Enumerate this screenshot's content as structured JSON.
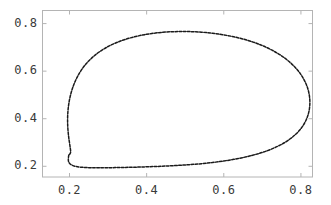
{
  "chart_data": {
    "type": "scatter",
    "title": "",
    "subtitle": "",
    "xlabel": "",
    "ylabel": "",
    "xlim": [
      0.13,
      0.83
    ],
    "ylim": [
      0.155,
      0.855
    ],
    "grid": false,
    "legend": null,
    "marker": "dot",
    "line_style": "dotted-closed-curve",
    "series_color": "#1a1a1a",
    "frame_color": "#b4b4b4",
    "background": "#ffffff",
    "xticks": [
      0.2,
      0.4,
      0.6,
      0.8
    ],
    "xtick_labels": [
      "0.2",
      "0.4",
      "0.6",
      "0.8"
    ],
    "yticks": [
      0.2,
      0.4,
      0.6,
      0.8
    ],
    "ytick_labels": [
      "0.2",
      "0.4",
      "0.6",
      "0.8"
    ],
    "series": [
      {
        "name": "orbit",
        "closed": true,
        "points": [
          [
            0.1985,
            0.248
          ],
          [
            0.197,
            0.233
          ],
          [
            0.1975,
            0.2205
          ],
          [
            0.201,
            0.211
          ],
          [
            0.2075,
            0.204
          ],
          [
            0.2165,
            0.1995
          ],
          [
            0.228,
            0.1965
          ],
          [
            0.242,
            0.1948
          ],
          [
            0.258,
            0.194
          ],
          [
            0.276,
            0.1938
          ],
          [
            0.296,
            0.194
          ],
          [
            0.318,
            0.1945
          ],
          [
            0.342,
            0.1952
          ],
          [
            0.368,
            0.1962
          ],
          [
            0.395,
            0.1975
          ],
          [
            0.423,
            0.1992
          ],
          [
            0.452,
            0.2012
          ],
          [
            0.482,
            0.2038
          ],
          [
            0.512,
            0.207
          ],
          [
            0.542,
            0.211
          ],
          [
            0.571,
            0.216
          ],
          [
            0.599,
            0.222
          ],
          [
            0.626,
            0.2292
          ],
          [
            0.652,
            0.2375
          ],
          [
            0.676,
            0.247
          ],
          [
            0.699,
            0.2578
          ],
          [
            0.72,
            0.27
          ],
          [
            0.7395,
            0.2838
          ],
          [
            0.757,
            0.299
          ],
          [
            0.7725,
            0.3158
          ],
          [
            0.786,
            0.334
          ],
          [
            0.7975,
            0.3535
          ],
          [
            0.8068,
            0.3745
          ],
          [
            0.814,
            0.3968
          ],
          [
            0.8192,
            0.42
          ],
          [
            0.8222,
            0.444
          ],
          [
            0.8232,
            0.4688
          ],
          [
            0.8222,
            0.4938
          ],
          [
            0.8192,
            0.5188
          ],
          [
            0.814,
            0.5435
          ],
          [
            0.8068,
            0.5678
          ],
          [
            0.7975,
            0.5915
          ],
          [
            0.786,
            0.6142
          ],
          [
            0.7725,
            0.6358
          ],
          [
            0.757,
            0.6562
          ],
          [
            0.7395,
            0.6752
          ],
          [
            0.72,
            0.6925
          ],
          [
            0.699,
            0.7082
          ],
          [
            0.676,
            0.7222
          ],
          [
            0.652,
            0.7342
          ],
          [
            0.626,
            0.7445
          ],
          [
            0.599,
            0.7528
          ],
          [
            0.571,
            0.7592
          ],
          [
            0.542,
            0.7638
          ],
          [
            0.512,
            0.7662
          ],
          [
            0.482,
            0.7665
          ],
          [
            0.452,
            0.7645
          ],
          [
            0.423,
            0.7602
          ],
          [
            0.395,
            0.7535
          ],
          [
            0.368,
            0.7442
          ],
          [
            0.342,
            0.7322
          ],
          [
            0.318,
            0.7175
          ],
          [
            0.296,
            0.7
          ],
          [
            0.276,
            0.6795
          ],
          [
            0.258,
            0.6558
          ],
          [
            0.242,
            0.629
          ],
          [
            0.2285,
            0.599
          ],
          [
            0.2172,
            0.566
          ],
          [
            0.2082,
            0.53
          ],
          [
            0.2015,
            0.4915
          ],
          [
            0.1972,
            0.451
          ],
          [
            0.1952,
            0.409
          ],
          [
            0.1955,
            0.3665
          ],
          [
            0.1978,
            0.3245
          ],
          [
            0.2012,
            0.2855
          ],
          [
            0.203,
            0.262
          ],
          [
            0.2012,
            0.252
          ]
        ],
        "control_note": "closed teardrop limit cycle; upper branch rises from left cusp to apex near (0.50,0.766) then descends right to (0.823,0.47); lower branch returns flat near y=0.194"
      }
    ]
  },
  "axes": {
    "x_tick_positions_px": [
      70,
      147,
      225,
      302
    ],
    "y_tick_positions_px": [
      167,
      116,
      65,
      14
    ]
  }
}
